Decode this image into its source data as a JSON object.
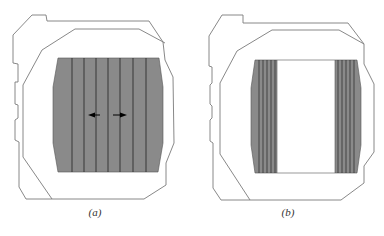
{
  "figure": {
    "panels": [
      {
        "id": "a",
        "caption": "(a)",
        "description": "Outer chamber outline with fully shaded central region divided by vertical lines; two arrows pointing outward (left and right) from the center",
        "fill_color": "#8a8a8a",
        "line_color": "#222222",
        "outline_color": "#777777",
        "arrows": [
          "left",
          "right"
        ]
      },
      {
        "id": "b",
        "caption": "(b)",
        "description": "Same outline; shaded regions only at left and right edges with closely spaced vertical lines, white center",
        "fill_color": "#8a8a8a",
        "line_color": "#222222",
        "outline_color": "#777777"
      }
    ]
  }
}
